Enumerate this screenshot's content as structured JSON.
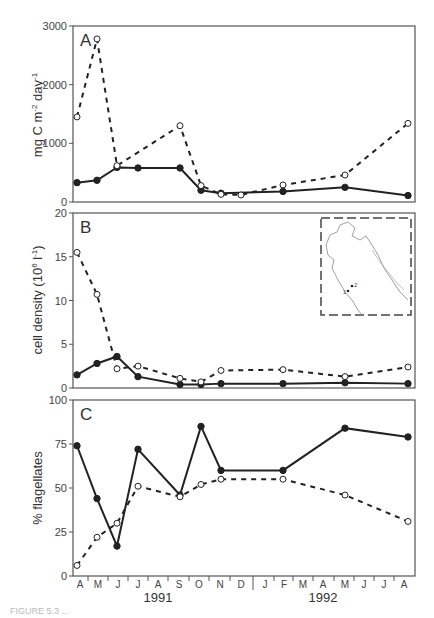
{
  "chart_data": [
    {
      "type": "line",
      "panel_label": "A",
      "title": "",
      "xlabel": "",
      "ylabel": "mg C m-2 day-1",
      "ylim": [
        0,
        3000
      ],
      "yticks": [
        0,
        1000,
        2000,
        3000
      ],
      "series": [
        {
          "name": "solid (filled circles)",
          "style": "solid",
          "x": [
            "Apr-91",
            "May-91",
            "Jun-91",
            "Jul-91",
            "Sep-91",
            "Oct-91",
            "Nov-91",
            "Feb-92",
            "May-92",
            "Jul-92"
          ],
          "values": [
            330,
            370,
            590,
            580,
            580,
            200,
            150,
            180,
            250,
            110
          ]
        },
        {
          "name": "dashed (open circles)",
          "style": "dashed",
          "x": [
            "Apr-91",
            "May-91",
            "Jun-91",
            "Sep-91",
            "Oct-91",
            "Nov-91",
            "Dec-91",
            "Feb-92",
            "May-92",
            "Jul-92"
          ],
          "values": [
            1450,
            2780,
            620,
            1300,
            280,
            130,
            120,
            290,
            460,
            1340
          ]
        }
      ]
    },
    {
      "type": "line",
      "panel_label": "B",
      "ylabel": "cell density (10^6 l^-1)",
      "ylim": [
        0,
        20
      ],
      "yticks": [
        0,
        5,
        10,
        15,
        20
      ],
      "inset": "map of northern Adriatic Sea with stations 1 and 2",
      "series": [
        {
          "name": "solid (filled circles)",
          "style": "solid",
          "x": [
            "Apr-91",
            "May-91",
            "Jun-91",
            "Jul-91",
            "Sep-91",
            "Oct-91",
            "Nov-91",
            "Feb-92",
            "May-92",
            "Jul-92"
          ],
          "values": [
            1.5,
            2.8,
            3.6,
            1.3,
            0.4,
            0.4,
            0.5,
            0.5,
            0.6,
            0.5
          ]
        },
        {
          "name": "dashed (open circles)",
          "style": "dashed",
          "x": [
            "Apr-91",
            "May-91",
            "Jun-91",
            "Jul-91",
            "Sep-91",
            "Oct-91",
            "Nov-91",
            "Feb-92",
            "May-92",
            "Jul-92"
          ],
          "values": [
            15.5,
            10.7,
            2.2,
            2.5,
            1.1,
            0.7,
            2.0,
            2.1,
            1.3,
            2.4
          ]
        }
      ]
    },
    {
      "type": "line",
      "panel_label": "C",
      "ylabel": "% flagellates",
      "ylim": [
        0,
        100
      ],
      "yticks": [
        0,
        25,
        50,
        75,
        100
      ],
      "series": [
        {
          "name": "solid (filled circles)",
          "style": "solid",
          "x": [
            "Apr-91",
            "May-91",
            "Jun-91",
            "Jul-91",
            "Sep-91",
            "Oct-91",
            "Nov-91",
            "Feb-92",
            "May-92",
            "Jul-92"
          ],
          "values": [
            74,
            44,
            17,
            72,
            46,
            85,
            60,
            60,
            84,
            79
          ]
        },
        {
          "name": "dashed (open circles)",
          "style": "dashed",
          "x": [
            "Apr-91",
            "May-91",
            "Jun-91",
            "Jul-91",
            "Sep-91",
            "Oct-91",
            "Nov-91",
            "Feb-92",
            "May-92",
            "Jul-92"
          ],
          "values": [
            6,
            22,
            30,
            51,
            45,
            52,
            55,
            55,
            46,
            31
          ]
        }
      ]
    }
  ],
  "axis": {
    "months": [
      "A",
      "M",
      "J",
      "J",
      "A",
      "S",
      "O",
      "N",
      "D",
      "J",
      "F",
      "M",
      "A",
      "M",
      "J",
      "J",
      "A"
    ],
    "years": [
      "1991",
      "1992"
    ]
  },
  "labels": {
    "panel_a": "A",
    "panel_b": "B",
    "panel_c": "C",
    "ylabel_a": "mg C m",
    "ylabel_b": "cell density (10",
    "ylabel_c": "% flagellates",
    "year_1991": "1991",
    "year_1992": "1992",
    "caption": "FIGURE 5.3  ..."
  }
}
